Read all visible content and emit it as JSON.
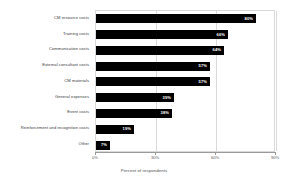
{
  "chart_data": {
    "type": "bar",
    "orientation": "horizontal",
    "title": "",
    "subtitle": "",
    "xlabel": "Percent of respondents",
    "ylabel": "",
    "xlim": [
      0,
      90
    ],
    "xticks": [
      "0%",
      "30%",
      "60%",
      "90%"
    ],
    "xtick_values": [
      0,
      30,
      60,
      90
    ],
    "grid": true,
    "grid_axis": "x",
    "legend": false,
    "legend_position": "none",
    "bar_color": "#000000",
    "label_color": "#ffffff",
    "categories": [
      "CM resource costs",
      "Training costs",
      "Communication costs",
      "External consultant costs",
      "CM materials",
      "General expenses",
      "Event costs",
      "Reinforcement and recognition costs",
      "Other"
    ],
    "values": [
      80,
      66,
      64,
      57,
      57,
      39,
      38,
      19,
      7
    ],
    "value_labels": [
      "80%",
      "66%",
      "64%",
      "57%",
      "57%",
      "39%",
      "38%",
      "19%",
      "7%"
    ]
  }
}
